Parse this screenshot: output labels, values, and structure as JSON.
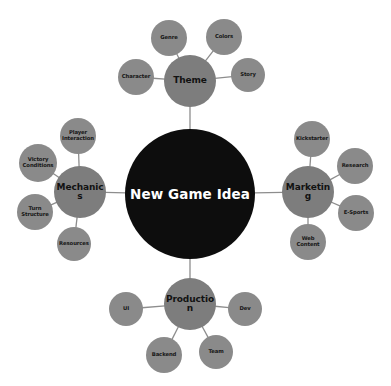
{
  "diagram": {
    "type": "mind-map",
    "title": "New Game Idea",
    "background_color": "#ffffff",
    "center": {
      "label": "New Game Idea",
      "color": "#0d0d0d",
      "text_color": "#ffffff",
      "cx": 190,
      "cy": 194,
      "r": 65
    },
    "branches": [
      {
        "label": "Theme",
        "color": "#7d7d7d",
        "cx": 190,
        "cy": 81,
        "r": 26,
        "children": [
          {
            "label": "Character",
            "cx": 136,
            "cy": 77,
            "r": 18
          },
          {
            "label": "Genre",
            "cx": 169,
            "cy": 38,
            "r": 18
          },
          {
            "label": "Colors",
            "cx": 224,
            "cy": 37,
            "r": 18
          },
          {
            "label": "Story",
            "cx": 248,
            "cy": 75,
            "r": 17
          }
        ]
      },
      {
        "label": "Mechanics",
        "color": "#7d7d7d",
        "cx": 80,
        "cy": 192,
        "r": 26,
        "children": [
          {
            "label": "Player Interaction",
            "cx": 78,
            "cy": 136,
            "r": 18
          },
          {
            "label": "Victory Conditions",
            "cx": 38,
            "cy": 163,
            "r": 19
          },
          {
            "label": "Turn Structure",
            "cx": 35,
            "cy": 212,
            "r": 18
          },
          {
            "label": "Resources",
            "cx": 74,
            "cy": 244,
            "r": 17
          }
        ]
      },
      {
        "label": "Marketing",
        "color": "#7d7d7d",
        "cx": 308,
        "cy": 192,
        "r": 26,
        "children": [
          {
            "label": "Kickstarter",
            "cx": 312,
            "cy": 139,
            "r": 18
          },
          {
            "label": "Research",
            "cx": 355,
            "cy": 166,
            "r": 18
          },
          {
            "label": "E-Sports",
            "cx": 356,
            "cy": 213,
            "r": 18
          },
          {
            "label": "Web Content",
            "cx": 308,
            "cy": 242,
            "r": 18
          }
        ]
      },
      {
        "label": "Production",
        "color": "#7d7d7d",
        "cx": 190,
        "cy": 304,
        "r": 26,
        "children": [
          {
            "label": "UI",
            "cx": 126,
            "cy": 309,
            "r": 17
          },
          {
            "label": "Dev",
            "cx": 245,
            "cy": 309,
            "r": 17
          },
          {
            "label": "Backend",
            "cx": 164,
            "cy": 355,
            "r": 18
          },
          {
            "label": "Team",
            "cx": 216,
            "cy": 352,
            "r": 17
          }
        ]
      }
    ],
    "edge_color": "#8d8d8d"
  }
}
